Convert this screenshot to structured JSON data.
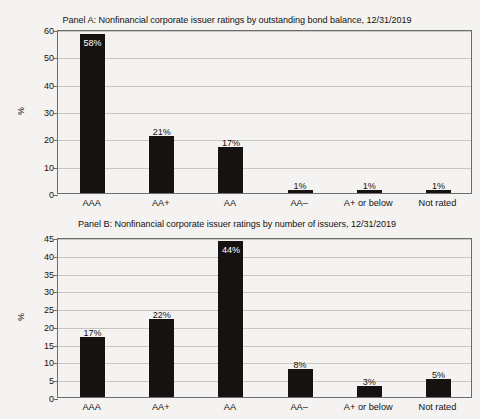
{
  "figure": {
    "background_color": "#f4f3f1",
    "bar_color": "#151211",
    "grid_color": "#c9c7c4",
    "frame_color": "#6d6d6d"
  },
  "panel_a": {
    "title": "Panel A: Nonfinancial corporate issuer ratings by outstanding bond balance, 12/31/2019",
    "ylabel": "%"
  },
  "panel_b": {
    "title": "Panel B: Nonfinancial corporate issuer ratings by number of issuers, 12/31/2019",
    "ylabel": "%"
  },
  "chart_data": [
    {
      "type": "bar",
      "title": "Panel A: Nonfinancial corporate issuer ratings by outstanding bond balance, 12/31/2019",
      "xlabel": "",
      "ylabel": "%",
      "categories": [
        "AAA",
        "AA+",
        "AA",
        "AA–",
        "A+ or below",
        "Not rated"
      ],
      "values": [
        58,
        21,
        17,
        1,
        1,
        1
      ],
      "data_labels": [
        "58%",
        "21%",
        "17%",
        "1%",
        "1%",
        "1%"
      ],
      "label_placement": [
        "inside",
        "above",
        "above",
        "above",
        "above",
        "above"
      ],
      "ylim": [
        0,
        60
      ],
      "yticks": [
        0,
        10,
        20,
        30,
        40,
        50,
        60
      ],
      "ytick_labels": [
        "0",
        "10",
        "20",
        "30",
        "40",
        "50",
        "60"
      ],
      "grid": true,
      "legend": "none"
    },
    {
      "type": "bar",
      "title": "Panel B: Nonfinancial corporate issuer ratings by number of issuers, 12/31/2019",
      "xlabel": "",
      "ylabel": "%",
      "categories": [
        "AAA",
        "AA+",
        "AA",
        "AA–",
        "A+ or below",
        "Not rated"
      ],
      "values": [
        17,
        22,
        44,
        8,
        3,
        5
      ],
      "data_labels": [
        "17%",
        "22%",
        "44%",
        "8%",
        "3%",
        "5%"
      ],
      "label_placement": [
        "above",
        "above",
        "inside",
        "above",
        "above",
        "above"
      ],
      "ylim": [
        0,
        45
      ],
      "yticks": [
        0,
        5,
        10,
        15,
        20,
        25,
        30,
        35,
        40,
        45
      ],
      "ytick_labels": [
        "0",
        "5",
        "10",
        "15",
        "20",
        "25",
        "30",
        "35",
        "40",
        "45"
      ],
      "grid": true,
      "legend": "none"
    }
  ]
}
